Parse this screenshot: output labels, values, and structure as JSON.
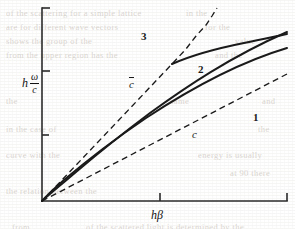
{
  "figure": {
    "kind": "dispersion-diagram",
    "background": "#ffffff",
    "ink_color": "#1a1a1a",
    "axes": {
      "x_label": "hβ",
      "y_label_prefix": "h",
      "y_label_numerator": "ω",
      "y_label_denominator": "c",
      "origin_px": [
        42,
        201
      ],
      "x_end_px": [
        287,
        201
      ],
      "y_top_px": [
        42,
        8
      ],
      "x_ticks_px": [
        160,
        287
      ],
      "y_ticks_px": [
        8,
        71,
        135
      ]
    },
    "curve_labels": [
      {
        "name": "curve-label-3",
        "text": "3",
        "x": 141,
        "y": 30,
        "style": "number"
      },
      {
        "name": "curve-label-2",
        "text": "2",
        "x": 198,
        "y": 63,
        "style": "number"
      },
      {
        "name": "curve-label-1",
        "text": "1",
        "x": 253,
        "y": 111,
        "style": "number"
      },
      {
        "name": "asymptote-label-cbar",
        "text": "c",
        "overbar": true,
        "x": 129,
        "y": 78,
        "style": "italic"
      },
      {
        "name": "asymptote-label-c",
        "text": "c",
        "overbar": false,
        "x": 192,
        "y": 128,
        "style": "italic"
      }
    ],
    "ghost_text_lines": [
      {
        "text": "of the scattering for a simple lattice",
        "x": 6,
        "y": 8
      },
      {
        "text": "are for different   wave vectors",
        "x": 6,
        "y": 22
      },
      {
        "text": "shows the group of the",
        "x": 6,
        "y": 36
      },
      {
        "text": "from the upper   region has the",
        "x": 6,
        "y": 50
      },
      {
        "text": "in the",
        "x": 186,
        "y": 8
      },
      {
        "text": "for the",
        "x": 205,
        "y": 22
      },
      {
        "text": "value",
        "x": 235,
        "y": 36
      },
      {
        "text": "and the",
        "x": 215,
        "y": 50
      },
      {
        "text": "the",
        "x": 6,
        "y": 96
      },
      {
        "text": "same",
        "x": 170,
        "y": 96
      },
      {
        "text": "and",
        "x": 262,
        "y": 96
      },
      {
        "text": "in the case of",
        "x": 6,
        "y": 124
      },
      {
        "text": "the",
        "x": 258,
        "y": 124
      },
      {
        "text": "curve with the",
        "x": 6,
        "y": 150
      },
      {
        "text": "energy is usually",
        "x": 198,
        "y": 150
      },
      {
        "text": "at 90 there",
        "x": 230,
        "y": 168
      },
      {
        "text": "the relation between the",
        "x": 6,
        "y": 186
      },
      {
        "text": "from",
        "x": 12,
        "y": 222
      },
      {
        "text": "of the scattered light is determined by the",
        "x": 86,
        "y": 222
      }
    ]
  },
  "chart_data": {
    "type": "line",
    "title": "",
    "xlabel": "hβ",
    "ylabel": "h ω/c",
    "grid": false,
    "legend": "inline-annotations",
    "xlim": [
      0,
      1
    ],
    "ylim": [
      0,
      1
    ],
    "note": "Normalized figure coordinates: x=0 at plot origin, x=1 at right axis end; y=0 at baseline, y=1 at top of y-axis.",
    "series": [
      {
        "name": "c-bar asymptote",
        "label": "c̄",
        "style": "dashed",
        "kind": "asymptote",
        "x": [
          0.0,
          0.53
        ],
        "y": [
          0.0,
          1.04
        ]
      },
      {
        "name": "c asymptote",
        "label": "c",
        "style": "dashed",
        "kind": "asymptote",
        "x": [
          0.0,
          1.0
        ],
        "y": [
          0.0,
          0.52
        ]
      },
      {
        "name": "branch-1",
        "label": "1",
        "style": "solid",
        "x": [
          0.0,
          0.06,
          0.12,
          0.2,
          0.3,
          0.45,
          0.6,
          0.8,
          1.0
        ],
        "y": [
          0.0,
          0.075,
          0.135,
          0.205,
          0.285,
          0.395,
          0.49,
          0.61,
          0.705
        ]
      },
      {
        "name": "branch-2",
        "label": "2",
        "style": "solid",
        "x": [
          0.0,
          0.05,
          0.1,
          0.18,
          0.28,
          0.42,
          0.58,
          0.78,
          1.0
        ],
        "y": [
          0.0,
          0.105,
          0.195,
          0.3,
          0.41,
          0.53,
          0.63,
          0.74,
          0.795
        ]
      },
      {
        "name": "branch-3",
        "label": "3",
        "style": "solid",
        "kind": "upper-branch",
        "x": [
          0.53,
          0.58,
          0.66,
          0.78,
          0.9,
          1.0
        ],
        "y": [
          0.705,
          0.745,
          0.79,
          0.835,
          0.86,
          0.875
        ]
      }
    ]
  }
}
